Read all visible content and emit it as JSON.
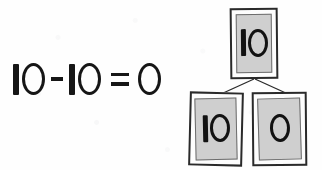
{
  "document": {
    "kind": "handwritten-math-worksheet",
    "background_color": "#fefefe",
    "ink_color": "#161616"
  },
  "equation": {
    "full_text": "10 - 10 = 0",
    "left_operand": "10",
    "operator": "-",
    "right_operand": "10",
    "equals": "=",
    "result": "0"
  },
  "number_bond": {
    "label": "number-bond",
    "card_fill_color": "#cfcfcf",
    "card_border_color": "#2a2a2a",
    "connector_color": "#2a2a2a",
    "whole": {
      "value": "10",
      "position": "top"
    },
    "parts": [
      {
        "value": "10",
        "position": "bottom-left"
      },
      {
        "value": "0",
        "position": "bottom-right"
      }
    ]
  }
}
